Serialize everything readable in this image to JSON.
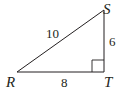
{
  "diagram": {
    "type": "right-triangle",
    "vertices": {
      "R": {
        "label": "R"
      },
      "S": {
        "label": "S"
      },
      "T": {
        "label": "T"
      }
    },
    "sides": {
      "RS": {
        "length": "10"
      },
      "ST": {
        "length": "6"
      },
      "RT": {
        "length": "8"
      }
    },
    "right_angle_at": "T",
    "stroke_color": "#231f20"
  }
}
